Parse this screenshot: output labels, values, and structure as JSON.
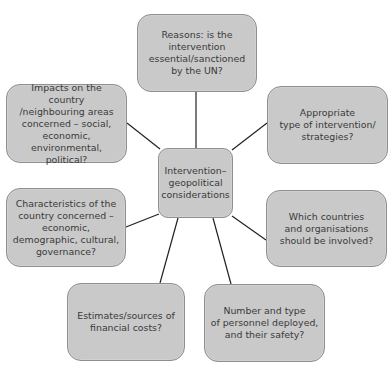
{
  "diagram": {
    "type": "mind-map",
    "colors": {
      "node_fill": "#c9c9c9",
      "node_border": "#8f8f8f",
      "text": "#3a3a3a",
      "connector": "#222222",
      "background": "#ffffff"
    },
    "center": {
      "label": "Intervention–\ngeopolitical\nconsiderations"
    },
    "nodes": [
      {
        "id": "reasons",
        "label": "Reasons: is the\nintervention\nessential/sanctioned\nby the UN?"
      },
      {
        "id": "appropriate-type",
        "label": "Appropriate\ntype of intervention/\nstrategies?"
      },
      {
        "id": "which-countries",
        "label": "Which countries\nand organisations\nshould be involved?"
      },
      {
        "id": "personnel",
        "label": "Number and type\nof personnel deployed,\nand their safety?"
      },
      {
        "id": "financial-costs",
        "label": "Estimates/sources of\nfinancial costs?"
      },
      {
        "id": "characteristics",
        "label": "Characteristics of the\ncountry concerned –\neconomic,\ndemographic, cultural,\ngovernance?"
      },
      {
        "id": "impacts",
        "label": "Impacts on the country\n/neighbouring areas\nconcerned – social,\neconomic, environmental,\npolitical?"
      }
    ]
  }
}
